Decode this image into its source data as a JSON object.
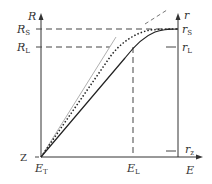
{
  "diagram": {
    "type": "response curve diagram",
    "left_axis": {
      "label": "R",
      "ticks": [
        {
          "main": "R",
          "sub": "S"
        },
        {
          "main": "R",
          "sub": "L"
        },
        {
          "main": "Z",
          "sub": ""
        }
      ]
    },
    "right_axis": {
      "label": "r",
      "ticks": [
        {
          "main": "r",
          "sub": "S"
        },
        {
          "main": "r",
          "sub": "L"
        },
        {
          "main": "r",
          "sub": "z"
        }
      ]
    },
    "x_axis": {
      "label": "E",
      "ticks": [
        {
          "main": "E",
          "sub": "T"
        },
        {
          "main": "E",
          "sub": "L"
        }
      ]
    },
    "curves": [
      {
        "name": "linear-reference",
        "style": "solid light gray"
      },
      {
        "name": "linear-extension",
        "style": "dashed gray"
      },
      {
        "name": "dotted-response",
        "style": "dotted dark"
      },
      {
        "name": "solid-response",
        "style": "solid dark"
      }
    ],
    "colors": {
      "axis": "#333333",
      "dash": "#444444",
      "gray_line": "#aaaaaa"
    }
  }
}
